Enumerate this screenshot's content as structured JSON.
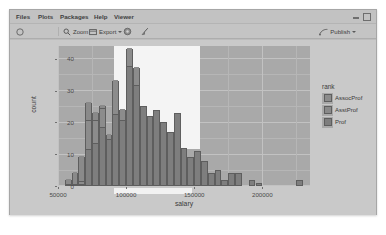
{
  "window": {
    "minimize_icon": "minimize-icon",
    "maximize_icon": "maximize-icon"
  },
  "menubar": {
    "items": [
      {
        "label": "Files",
        "left": 6
      },
      {
        "label": "Plots",
        "left": 28
      },
      {
        "label": "Packages",
        "left": 50
      },
      {
        "label": "Help",
        "left": 84
      },
      {
        "label": "Viewer",
        "left": 104
      }
    ]
  },
  "toolbar": {
    "back_icon": "back-arrow-icon",
    "zoom_label": "Zoom",
    "zoom_icon": "magnifier-icon",
    "export_label": "Export",
    "export_icon": "export-icon",
    "export_caret": "chevron-down-icon",
    "remove_icon": "gear-icon",
    "clear_icon": "broom-icon",
    "publish_label": "Publish",
    "publish_icon": "publish-icon",
    "publish_caret": "chevron-down-icon"
  },
  "colors": {
    "panel": "#a9a9a9",
    "bar_assocprof": "#8c8c8c",
    "bar_asstprof": "#8a8a8a",
    "bar_prof": "#7e7e7e",
    "overlay": "#f4f4f4",
    "window_bg": "#bcbcbc"
  },
  "chart_data": {
    "type": "bar",
    "subtype": "stacked-histogram",
    "title": "",
    "xlabel": "salary",
    "ylabel": "count",
    "xlim": [
      50000,
      235000
    ],
    "ylim": [
      0,
      44
    ],
    "xticks": [
      50000,
      100000,
      150000,
      200000
    ],
    "xtick_labels": [
      "50000",
      "100000",
      "150000",
      "200000"
    ],
    "yticks": [
      0,
      10,
      20,
      30,
      40
    ],
    "ytick_labels": [
      "0",
      "10",
      "20",
      "30",
      "40"
    ],
    "grid": true,
    "legend": {
      "title": "rank",
      "position": "right",
      "entries": [
        {
          "label": "AssocProf",
          "color": "#8c8c8c"
        },
        {
          "label": "AsstProf",
          "color": "#8a8a8a"
        },
        {
          "label": "Prof",
          "color": "#7e7e7e"
        }
      ]
    },
    "bin_width": 5000,
    "bins": [
      {
        "x": 55000,
        "total": 2,
        "prof": 0,
        "assocprof": 0,
        "asstprof": 2
      },
      {
        "x": 60000,
        "total": 4,
        "prof": 0,
        "assocprof": 0,
        "asstprof": 4
      },
      {
        "x": 65000,
        "total": 9,
        "prof": 0,
        "assocprof": 1,
        "asstprof": 8
      },
      {
        "x": 70000,
        "total": 26,
        "prof": 11,
        "assocprof": 9,
        "asstprof": 6
      },
      {
        "x": 75000,
        "total": 23,
        "prof": 13,
        "assocprof": 7,
        "asstprof": 3
      },
      {
        "x": 80000,
        "total": 25,
        "prof": 18,
        "assocprof": 6,
        "asstprof": 1
      },
      {
        "x": 85000,
        "total": 16,
        "prof": 14,
        "assocprof": 2,
        "asstprof": 0
      },
      {
        "x": 90000,
        "total": 33,
        "prof": 22,
        "assocprof": 11,
        "asstprof": 0
      },
      {
        "x": 95000,
        "total": 24,
        "prof": 20,
        "assocprof": 4,
        "asstprof": 0
      },
      {
        "x": 100000,
        "total": 43,
        "prof": 37,
        "assocprof": 6,
        "asstprof": 0
      },
      {
        "x": 105000,
        "total": 37,
        "prof": 31,
        "assocprof": 6,
        "asstprof": 0
      },
      {
        "x": 110000,
        "total": 25,
        "prof": 25,
        "assocprof": 0,
        "asstprof": 0
      },
      {
        "x": 115000,
        "total": 22,
        "prof": 22,
        "assocprof": 0,
        "asstprof": 0
      },
      {
        "x": 120000,
        "total": 24,
        "prof": 24,
        "assocprof": 0,
        "asstprof": 0
      },
      {
        "x": 125000,
        "total": 20,
        "prof": 20,
        "assocprof": 0,
        "asstprof": 0
      },
      {
        "x": 130000,
        "total": 17,
        "prof": 17,
        "assocprof": 0,
        "asstprof": 0
      },
      {
        "x": 135000,
        "total": 23,
        "prof": 23,
        "assocprof": 0,
        "asstprof": 0
      },
      {
        "x": 140000,
        "total": 12,
        "prof": 12,
        "assocprof": 0,
        "asstprof": 0
      },
      {
        "x": 145000,
        "total": 9,
        "prof": 9,
        "assocprof": 0,
        "asstprof": 0
      },
      {
        "x": 150000,
        "total": 11,
        "prof": 11,
        "assocprof": 0,
        "asstprof": 0
      },
      {
        "x": 155000,
        "total": 8,
        "prof": 8,
        "assocprof": 0,
        "asstprof": 0
      },
      {
        "x": 160000,
        "total": 4,
        "prof": 4,
        "assocprof": 0,
        "asstprof": 0
      },
      {
        "x": 165000,
        "total": 5,
        "prof": 5,
        "assocprof": 0,
        "asstprof": 0
      },
      {
        "x": 170000,
        "total": 2,
        "prof": 2,
        "assocprof": 0,
        "asstprof": 0
      },
      {
        "x": 175000,
        "total": 4,
        "prof": 4,
        "assocprof": 0,
        "asstprof": 0
      },
      {
        "x": 180000,
        "total": 4,
        "prof": 4,
        "assocprof": 0,
        "asstprof": 0
      },
      {
        "x": 185000,
        "total": 0,
        "prof": 0,
        "assocprof": 0,
        "asstprof": 0
      },
      {
        "x": 190000,
        "total": 2,
        "prof": 2,
        "assocprof": 0,
        "asstprof": 0
      },
      {
        "x": 195000,
        "total": 1,
        "prof": 1,
        "assocprof": 0,
        "asstprof": 0
      },
      {
        "x": 200000,
        "total": 0,
        "prof": 0,
        "assocprof": 0,
        "asstprof": 0
      },
      {
        "x": 225000,
        "total": 2,
        "prof": 2,
        "assocprof": 0,
        "asstprof": 0
      }
    ]
  }
}
